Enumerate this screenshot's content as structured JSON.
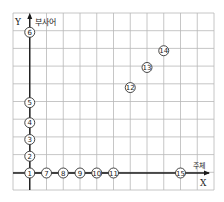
{
  "diagram": {
    "y_axis": {
      "letter": "Y",
      "label": "부사어"
    },
    "x_axis": {
      "letter": "X",
      "label": "주체"
    },
    "grid": {
      "columns": 12,
      "rows": 10
    },
    "points": [
      {
        "id": "1",
        "glyph": "①",
        "gx": 1,
        "gy": 0
      },
      {
        "id": "2",
        "glyph": "②",
        "gx": 1,
        "gy": 1
      },
      {
        "id": "3",
        "glyph": "③",
        "gx": 1,
        "gy": 2
      },
      {
        "id": "4",
        "glyph": "④",
        "gx": 1,
        "gy": 3
      },
      {
        "id": "5",
        "glyph": "⑤",
        "gx": 1,
        "gy": 4.2
      },
      {
        "id": "6",
        "glyph": "⑥",
        "gx": 1,
        "gy": 8.4
      },
      {
        "id": "7",
        "glyph": "⑦",
        "gx": 2,
        "gy": 0
      },
      {
        "id": "8",
        "glyph": "⑧",
        "gx": 3,
        "gy": 0
      },
      {
        "id": "9",
        "glyph": "⑨",
        "gx": 4,
        "gy": 0
      },
      {
        "id": "10",
        "glyph": "⑩",
        "gx": 5,
        "gy": 0
      },
      {
        "id": "11",
        "glyph": "⑪",
        "gx": 6,
        "gy": 0
      },
      {
        "id": "12",
        "glyph": "⑫",
        "gx": 7,
        "gy": 5.1
      },
      {
        "id": "13",
        "glyph": "⑬",
        "gx": 8,
        "gy": 6.3
      },
      {
        "id": "14",
        "glyph": "⑭",
        "gx": 9,
        "gy": 7.3
      },
      {
        "id": "15",
        "glyph": "⑮",
        "gx": 10,
        "gy": 0
      }
    ],
    "connectors": [
      {
        "from": "1",
        "to": "2",
        "style": "dash"
      },
      {
        "from": "2",
        "to": "3",
        "style": "dash"
      },
      {
        "from": "3",
        "to": "4",
        "style": "dash"
      },
      {
        "from": "4",
        "to": "5",
        "style": "dash"
      },
      {
        "from": "1",
        "to": "7",
        "style": "dash"
      },
      {
        "from": "7",
        "to": "8",
        "style": "dash"
      },
      {
        "from": "8",
        "to": "9",
        "style": "dash"
      },
      {
        "from": "9",
        "to": "10",
        "style": "dash"
      },
      {
        "from": "10",
        "to": "11",
        "style": "dash"
      }
    ]
  }
}
